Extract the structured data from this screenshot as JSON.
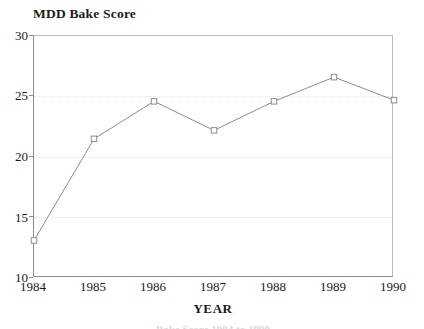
{
  "chart_data": {
    "type": "line",
    "title": "MDD Bake Score",
    "xlabel": "YEAR",
    "ylabel": "",
    "categories": [
      "1984",
      "1985",
      "1986",
      "1987",
      "1988",
      "1989",
      "1990"
    ],
    "x": [
      1984,
      1985,
      1986,
      1987,
      1988,
      1989,
      1990
    ],
    "values": [
      13.1,
      21.5,
      24.6,
      22.2,
      24.6,
      26.6,
      24.7
    ],
    "series": [
      {
        "name": "MDD Bake Score",
        "values": [
          13.1,
          21.5,
          24.6,
          22.2,
          24.6,
          26.6,
          24.7
        ]
      }
    ],
    "ylim": [
      10,
      30
    ],
    "xlim": [
      1984,
      1990
    ],
    "yticks": [
      "10",
      "15",
      "20",
      "25",
      "30"
    ],
    "ytick_values": [
      10,
      15,
      20,
      25,
      30
    ],
    "xticks": [
      "1984",
      "1985",
      "1986",
      "1987",
      "1988",
      "1989",
      "1990"
    ],
    "grid": "horizontal-dotted",
    "legend": "none",
    "marker": "open-square",
    "line_color": "#8c8c8c",
    "marker_color": "#8c8c8c",
    "grid_color": "#e2e2ea",
    "axis_color": "#8c8c8c",
    "text_color": "#1a1a1a"
  },
  "caption": {
    "bottom_fragment": "Bake Score 1984 to 1990"
  }
}
